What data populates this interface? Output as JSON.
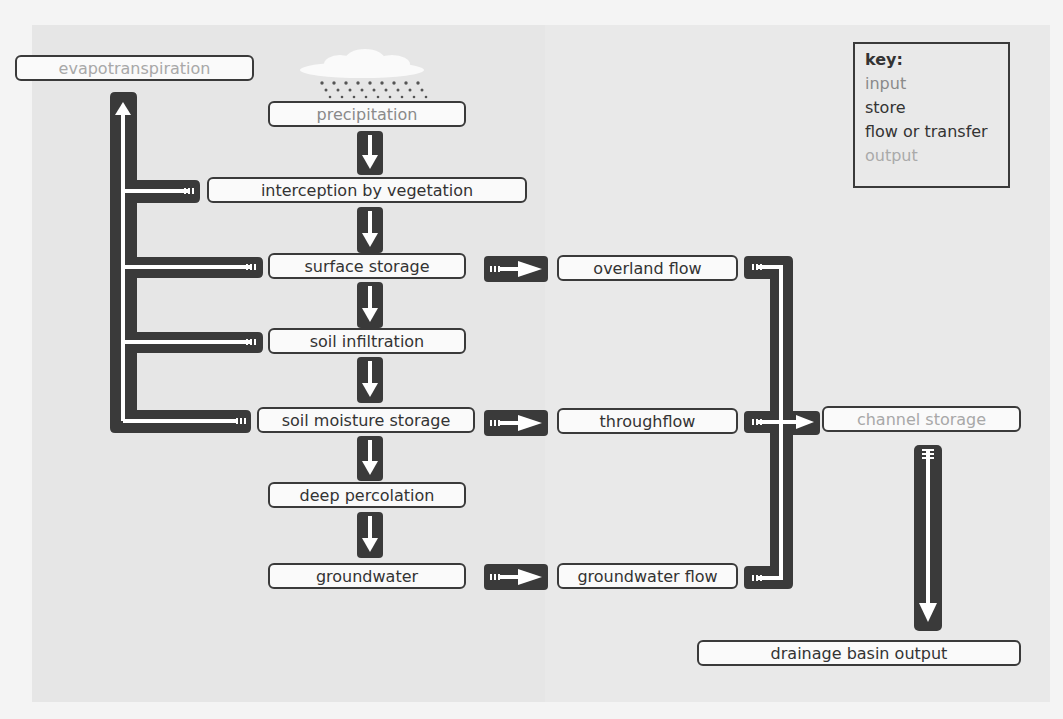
{
  "diagram": {
    "type": "flow-diagram",
    "nodes": {
      "evapotranspiration": {
        "label": "evapotranspiration",
        "kind": "output"
      },
      "precipitation": {
        "label": "precipitation",
        "kind": "input"
      },
      "interception": {
        "label": "interception by vegetation",
        "kind": "store"
      },
      "surface_storage": {
        "label": "surface storage",
        "kind": "store"
      },
      "soil_infiltration": {
        "label": "soil infiltration",
        "kind": "flow"
      },
      "soil_moisture": {
        "label": "soil moisture storage",
        "kind": "store"
      },
      "deep_percolation": {
        "label": "deep percolation",
        "kind": "flow"
      },
      "groundwater": {
        "label": "groundwater",
        "kind": "store"
      },
      "overland_flow": {
        "label": "overland flow",
        "kind": "flow"
      },
      "throughflow": {
        "label": "throughflow",
        "kind": "flow"
      },
      "groundwater_flow": {
        "label": "groundwater flow",
        "kind": "flow"
      },
      "channel_storage": {
        "label": "channel storage",
        "kind": "output"
      },
      "drainage_output": {
        "label": "drainage basin output",
        "kind": "store"
      }
    },
    "edges": [
      [
        "precipitation",
        "interception"
      ],
      [
        "interception",
        "surface_storage"
      ],
      [
        "surface_storage",
        "soil_infiltration"
      ],
      [
        "soil_infiltration",
        "soil_moisture"
      ],
      [
        "soil_moisture",
        "deep_percolation"
      ],
      [
        "deep_percolation",
        "groundwater"
      ],
      [
        "surface_storage",
        "overland_flow"
      ],
      [
        "soil_moisture",
        "throughflow"
      ],
      [
        "groundwater",
        "groundwater_flow"
      ],
      [
        "overland_flow",
        "channel_storage"
      ],
      [
        "throughflow",
        "channel_storage"
      ],
      [
        "groundwater_flow",
        "channel_storage"
      ],
      [
        "channel_storage",
        "drainage_output"
      ],
      [
        "interception",
        "evapotranspiration"
      ],
      [
        "surface_storage",
        "evapotranspiration"
      ],
      [
        "soil_infiltration",
        "evapotranspiration"
      ],
      [
        "soil_moisture",
        "evapotranspiration"
      ]
    ]
  },
  "key": {
    "title": "key:",
    "input": "input",
    "store": "store",
    "flow": "flow or transfer",
    "output": "output"
  },
  "colors": {
    "arrow": "#3a3a3a",
    "arrow_inner": "#ffffff",
    "background": "#e6e6e6",
    "input_text": "#8a8a8a",
    "output_text": "#a8a8a8",
    "store_text": "#333333"
  }
}
